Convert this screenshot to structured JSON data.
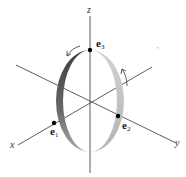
{
  "diagram": {
    "title": "",
    "axes": {
      "x_label": "x",
      "y_label": "y",
      "z_label": "z"
    },
    "points": [
      {
        "name": "e1",
        "label": "e",
        "sub": "1"
      },
      {
        "name": "e2",
        "label": "e",
        "sub": "2"
      },
      {
        "name": "e3",
        "label": "e",
        "sub": "3"
      }
    ],
    "ring": {
      "dark_color": "#4a4a4a",
      "light_color": "#c8c8c8",
      "description": "circular band in the plane containing e1, e2, e3 with rotation arrows"
    },
    "stray_mark": "'",
    "line_color": "#333333"
  }
}
